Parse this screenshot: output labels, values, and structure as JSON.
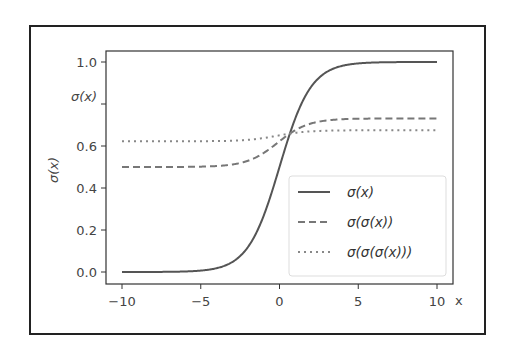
{
  "chart_data": {
    "type": "line",
    "title": "",
    "xlabel": "x",
    "ylabel": "σ(x)",
    "xlim": [
      -10.5,
      10.5
    ],
    "ylim": [
      -0.05,
      1.05
    ],
    "x_ticks": [
      -10,
      -5,
      0,
      5,
      10
    ],
    "x_tick_labels": [
      "−10",
      "−5",
      "0",
      "5",
      "10"
    ],
    "y_ticks": [
      0.0,
      0.2,
      0.4,
      0.6,
      0.8,
      1.0
    ],
    "y_tick_labels": [
      "0.0",
      "0.2",
      "0.4",
      "0.6",
      "σ(x)",
      "1.0"
    ],
    "grid": false,
    "legend_position": "lower right",
    "series": [
      {
        "name": "σ(x)",
        "style": "solid",
        "color": "#555555",
        "x": [
          -10,
          -5,
          -3,
          -2,
          -1,
          0,
          1,
          2,
          3,
          5,
          10
        ],
        "values": [
          0.0,
          0.0067,
          0.0474,
          0.1192,
          0.2689,
          0.5,
          0.7311,
          0.8808,
          0.9526,
          0.9933,
          1.0
        ]
      },
      {
        "name": "σ(σ(x))",
        "style": "dashed",
        "color": "#777777",
        "x": [
          -10,
          -5,
          -3,
          -2,
          -1,
          0,
          1,
          2,
          3,
          5,
          10
        ],
        "values": [
          0.5,
          0.5017,
          0.5119,
          0.5298,
          0.5668,
          0.6225,
          0.675,
          0.707,
          0.7216,
          0.7298,
          0.7311
        ]
      },
      {
        "name": "σ(σ(σ(x)))",
        "style": "dotted",
        "color": "#888888",
        "x": [
          -10,
          -5,
          -3,
          -2,
          -1,
          0,
          1,
          2,
          3,
          5,
          10
        ],
        "values": [
          0.6225,
          0.6229,
          0.6253,
          0.6294,
          0.638,
          0.6508,
          0.6626,
          0.6697,
          0.6729,
          0.6747,
          0.675
        ]
      }
    ]
  },
  "labels": {
    "y_axis_label": "σ(x)",
    "x_axis_label": "x"
  },
  "legend": [
    {
      "label": "σ(x)",
      "style": "solid"
    },
    {
      "label": "σ(σ(x))",
      "style": "dashed"
    },
    {
      "label": "σ(σ(σ(x)))",
      "style": "dotted"
    }
  ]
}
